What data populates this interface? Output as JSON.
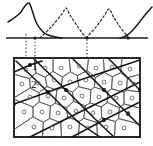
{
  "figure": {
    "name": "polycrystal-slip-band-figure",
    "background": "#ffffff",
    "width": 153,
    "height": 146,
    "ink_color": "#1a1a1a",
    "grain_line_color": "#555555",
    "bold_line_color": "#111111",
    "dotted_color": "#333333"
  },
  "labels": {
    "grain_label_1": "1",
    "grain_label_2": "2"
  },
  "chart_data": {
    "type": "line",
    "title": "",
    "xlabel": "",
    "ylabel": "",
    "grid": false,
    "legend": null,
    "xlim": [
      0,
      153
    ],
    "ylim": [
      0,
      38
    ],
    "baseline_y": 38,
    "series": [
      {
        "name": "solid-peak-left",
        "style": "solid",
        "points": [
          [
            8,
            22
          ],
          [
            14,
            18
          ],
          [
            20,
            13
          ],
          [
            25,
            6
          ],
          [
            29,
            3
          ],
          [
            32,
            10
          ],
          [
            36,
            22
          ],
          [
            42,
            31
          ],
          [
            48,
            35
          ],
          [
            56,
            37
          ],
          [
            62,
            38
          ]
        ]
      },
      {
        "name": "solid-curve-right",
        "style": "solid",
        "points": [
          [
            120,
            38
          ],
          [
            126,
            36
          ],
          [
            132,
            31
          ],
          [
            138,
            24
          ],
          [
            145,
            15
          ],
          [
            152,
            7
          ]
        ]
      },
      {
        "name": "dashed-peak-1",
        "style": "dashed",
        "points": [
          [
            40,
            38
          ],
          [
            52,
            26
          ],
          [
            62,
            14
          ],
          [
            66,
            8
          ],
          [
            70,
            15
          ],
          [
            78,
            27
          ],
          [
            86,
            38
          ]
        ]
      },
      {
        "name": "dashed-peak-2",
        "style": "dashed",
        "points": [
          [
            86,
            38
          ],
          [
            96,
            27
          ],
          [
            104,
            16
          ],
          [
            109,
            9
          ],
          [
            113,
            16
          ],
          [
            120,
            27
          ],
          [
            128,
            37
          ]
        ]
      }
    ],
    "annotations": [
      {
        "name": "baseline",
        "type": "hline",
        "y": 38,
        "x0": 6,
        "x1": 148
      },
      {
        "name": "projection-line-a",
        "type": "vline",
        "x": 26,
        "y0": 34,
        "y1": 60
      },
      {
        "name": "projection-line-b",
        "type": "vline",
        "x": 35,
        "y0": 38,
        "y1": 60
      },
      {
        "name": "projection-line-c",
        "type": "vline",
        "x": 87,
        "y0": 36,
        "y1": 92
      },
      {
        "name": "baseline-marker-a",
        "type": "point",
        "x": 35,
        "y": 38
      },
      {
        "name": "baseline-marker-b",
        "type": "point",
        "x": 87,
        "y": 38
      },
      {
        "name": "baseline-marker-c",
        "type": "point",
        "x": 128,
        "y": 38
      }
    ]
  },
  "microstructure": {
    "name": "polycrystal-box",
    "box": {
      "x": 14,
      "y": 58,
      "width": 126,
      "height": 79
    },
    "grain_centers": [
      [
        26,
        70
      ],
      [
        45,
        68
      ],
      [
        61,
        68
      ],
      [
        79,
        66
      ],
      [
        96,
        68
      ],
      [
        112,
        67
      ],
      [
        130,
        69
      ],
      [
        22,
        84
      ],
      [
        38,
        83
      ],
      [
        54,
        80
      ],
      [
        70,
        82
      ],
      [
        86,
        80
      ],
      [
        104,
        82
      ],
      [
        120,
        83
      ],
      [
        134,
        84
      ],
      [
        30,
        97
      ],
      [
        48,
        96
      ],
      [
        64,
        98
      ],
      [
        82,
        96
      ],
      [
        99,
        97
      ],
      [
        116,
        98
      ],
      [
        132,
        98
      ],
      [
        24,
        112
      ],
      [
        42,
        112
      ],
      [
        58,
        113
      ],
      [
        76,
        111
      ],
      [
        93,
        113
      ],
      [
        110,
        112
      ],
      [
        128,
        113
      ],
      [
        34,
        127
      ],
      [
        52,
        128
      ],
      [
        70,
        127
      ],
      [
        88,
        128
      ],
      [
        106,
        127
      ],
      [
        124,
        128
      ]
    ],
    "grain_marker": "small-circle",
    "slip_bands": [
      {
        "name": "slip-band-1",
        "points": [
          [
            16,
            61
          ],
          [
            48,
            92
          ],
          [
            78,
            122
          ],
          [
            100,
            137
          ]
        ]
      },
      {
        "name": "slip-band-2",
        "points": [
          [
            33,
            58
          ],
          [
            66,
            90
          ],
          [
            95,
            119
          ],
          [
            114,
            137
          ]
        ]
      },
      {
        "name": "slip-band-3",
        "points": [
          [
            72,
            58
          ],
          [
            104,
            90
          ],
          [
            128,
            114
          ],
          [
            140,
            126
          ]
        ]
      },
      {
        "name": "slip-band-4",
        "points": [
          [
            108,
            58
          ],
          [
            140,
            90
          ]
        ]
      },
      {
        "name": "slip-band-5",
        "points": [
          [
            14,
            104
          ],
          [
            48,
            92
          ],
          [
            80,
            80
          ],
          [
            110,
            70
          ],
          [
            140,
            60
          ]
        ]
      },
      {
        "name": "slip-band-6",
        "points": [
          [
            30,
            137
          ],
          [
            66,
            119
          ],
          [
            104,
            100
          ],
          [
            140,
            82
          ]
        ]
      },
      {
        "name": "slip-band-7",
        "points": [
          [
            72,
            137
          ],
          [
            104,
            120
          ],
          [
            140,
            102
          ]
        ]
      },
      {
        "name": "slip-band-8",
        "points": [
          [
            14,
            72
          ],
          [
            30,
            65
          ],
          [
            42,
            61
          ]
        ]
      }
    ],
    "nodes": [
      [
        48,
        92
      ],
      [
        66,
        90
      ],
      [
        104,
        90
      ],
      [
        30,
        65
      ],
      [
        14,
        104
      ],
      [
        140,
        90
      ],
      [
        128,
        114
      ],
      [
        104,
        120
      ]
    ]
  }
}
